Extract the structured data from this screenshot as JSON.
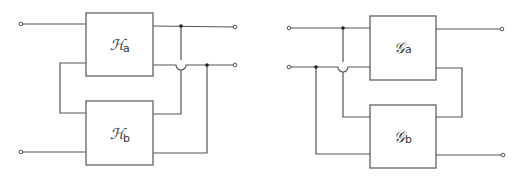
{
  "diagram": {
    "colors": {
      "line": "#555555",
      "junction": "#222222",
      "background": "#ffffff"
    },
    "left_network": {
      "blocks": [
        {
          "id": "Ha",
          "symbol": "ℋ",
          "subscript": "a"
        },
        {
          "id": "Hb",
          "symbol": "ℋ",
          "subscript": "b"
        }
      ]
    },
    "right_network": {
      "blocks": [
        {
          "id": "Ga",
          "symbol": "𝒢",
          "subscript": "a"
        },
        {
          "id": "Gb",
          "symbol": "𝒢",
          "subscript": "b"
        }
      ]
    }
  }
}
